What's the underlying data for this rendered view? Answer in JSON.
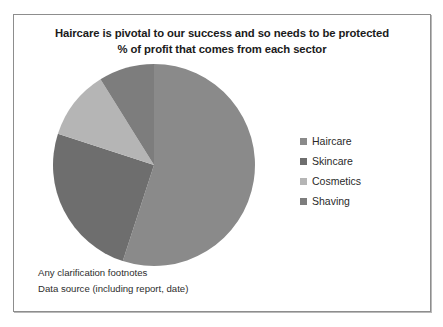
{
  "slide": {
    "title_line_1": "Haircare is pivotal to our success and so needs to be protected",
    "title_line_2": "% of profit that comes from each sector",
    "footnote_1": "Any clarification footnotes",
    "footnote_2": "Data source (including report, date)",
    "frame_border_color": "#8d8d8d",
    "background_color": "#ffffff"
  },
  "chart_data": {
    "type": "pie",
    "title": "Haircare is pivotal to our success and so needs to be protected",
    "subtitle": "% of profit that comes from each sector",
    "categories": [
      "Haircare",
      "Skincare",
      "Cosmetics",
      "Shaving"
    ],
    "values": [
      55,
      25,
      11,
      9
    ],
    "colors": [
      "#8a8a8a",
      "#6e6e6e",
      "#b5b5b5",
      "#7d7d7d"
    ],
    "start_angle": 0,
    "direction": "clockwise",
    "legend_position": "right",
    "grid": false,
    "slices": [
      {
        "label": "Haircare",
        "value": 55,
        "color": "#8a8a8a",
        "start_deg": 0,
        "end_deg": 198
      },
      {
        "label": "Skincare",
        "value": 25,
        "color": "#6e6e6e",
        "start_deg": 198,
        "end_deg": 288
      },
      {
        "label": "Cosmetics",
        "value": 11,
        "color": "#b5b5b5",
        "start_deg": 288,
        "end_deg": 328
      },
      {
        "label": "Shaving",
        "value": 9,
        "color": "#7d7d7d",
        "start_deg": 328,
        "end_deg": 360
      }
    ]
  },
  "legend": {
    "items": [
      {
        "label": "Haircare",
        "color": "#8a8a8a"
      },
      {
        "label": "Skincare",
        "color": "#6e6e6e"
      },
      {
        "label": "Cosmetics",
        "color": "#b5b5b5"
      },
      {
        "label": "Shaving",
        "color": "#7d7d7d"
      }
    ]
  }
}
